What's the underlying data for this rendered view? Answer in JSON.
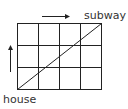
{
  "diagram": {
    "grid": {
      "columns": 4,
      "rows": 3,
      "line_color": "#222222"
    },
    "labels": {
      "start": "house",
      "end": "subway"
    },
    "arrows": [
      {
        "name": "right-arrow",
        "direction": "right"
      },
      {
        "name": "up-arrow",
        "direction": "up"
      }
    ],
    "diagonal": {
      "from": "house",
      "to": "subway"
    }
  }
}
